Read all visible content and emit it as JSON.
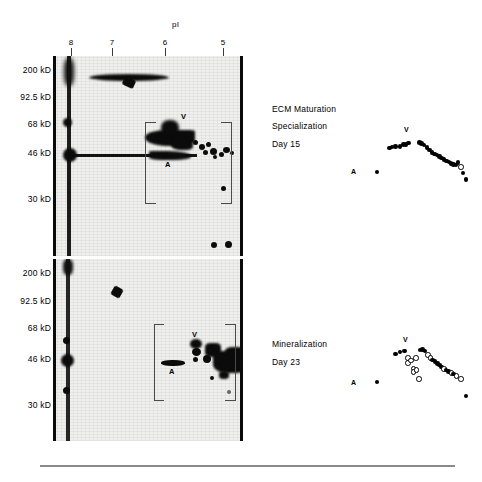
{
  "figure": {
    "axis": {
      "pi_label": "pI",
      "pi_ticks": [
        "8",
        "7",
        "6",
        "5"
      ],
      "mw_labels": [
        "200 kD",
        "92.5 kD",
        "68 kD",
        "46 kD",
        "30 kD"
      ]
    },
    "panels": [
      {
        "id": "panel-top",
        "gel_marks": {
          "v": "V",
          "a": "A"
        },
        "caption_lines": [
          "ECM Maturation",
          "Specialization",
          "Day 15"
        ],
        "schematic_marks": {
          "v": "V",
          "a": "A"
        }
      },
      {
        "id": "panel-bottom",
        "gel_marks": {
          "v": "V",
          "a": "A"
        },
        "caption_lines": [
          "Mineralization",
          "Day 23"
        ],
        "schematic_marks": {
          "v": "V",
          "a": "A"
        }
      }
    ]
  },
  "chart_data": {
    "type": "scatter",
    "xlabel": "pI",
    "ylabel": "Molecular weight (kD)",
    "xlim": [
      8.4,
      4.6
    ],
    "ylim": [
      20,
      230
    ],
    "xticks": [
      8,
      7,
      6,
      5
    ],
    "yticks": [
      200,
      92.5,
      68,
      46,
      30
    ],
    "grid": false,
    "legend": [
      "filled circle = spot present",
      "open circle = spot reduced/absent"
    ],
    "series": [
      {
        "name": "ECM Maturation Specialization Day 15",
        "marker": "filled",
        "annotations": [
          {
            "label": "V",
            "x": 6.55,
            "y": 58
          },
          {
            "label": "A",
            "x": 7.45,
            "y": 40
          }
        ],
        "points": [
          {
            "x": 7.46,
            "y": 40.5,
            "fill": "filled"
          },
          {
            "x": 7.1,
            "y": 53.0,
            "fill": "filled"
          },
          {
            "x": 7.02,
            "y": 53.4,
            "fill": "filled"
          },
          {
            "x": 6.93,
            "y": 53.6,
            "fill": "filled"
          },
          {
            "x": 6.8,
            "y": 53.8,
            "fill": "filled"
          },
          {
            "x": 6.7,
            "y": 54.6,
            "fill": "filled"
          },
          {
            "x": 6.62,
            "y": 54.8,
            "fill": "filled"
          },
          {
            "x": 6.55,
            "y": 55.4,
            "fill": "filled"
          },
          {
            "x": 6.24,
            "y": 55.8,
            "fill": "filled"
          },
          {
            "x": 6.18,
            "y": 55.2,
            "fill": "filled"
          },
          {
            "x": 6.1,
            "y": 54.4,
            "fill": "filled"
          },
          {
            "x": 6.02,
            "y": 53.2,
            "fill": "filled"
          },
          {
            "x": 5.95,
            "y": 51.9,
            "fill": "filled"
          },
          {
            "x": 5.88,
            "y": 50.6,
            "fill": "filled"
          },
          {
            "x": 5.8,
            "y": 49.8,
            "fill": "filled"
          },
          {
            "x": 5.73,
            "y": 49.2,
            "fill": "filled"
          },
          {
            "x": 5.66,
            "y": 48.6,
            "fill": "filled"
          },
          {
            "x": 5.6,
            "y": 47.8,
            "fill": "filled"
          },
          {
            "x": 5.53,
            "y": 47.0,
            "fill": "filled"
          },
          {
            "x": 5.46,
            "y": 46.2,
            "fill": "filled"
          },
          {
            "x": 5.39,
            "y": 45.6,
            "fill": "filled"
          },
          {
            "x": 5.33,
            "y": 45.0,
            "fill": "filled"
          },
          {
            "x": 5.26,
            "y": 44.4,
            "fill": "filled"
          },
          {
            "x": 5.19,
            "y": 44.0,
            "fill": "filled"
          },
          {
            "x": 5.12,
            "y": 45.4,
            "fill": "filled"
          },
          {
            "x": 5.05,
            "y": 43.4,
            "fill": "open"
          },
          {
            "x": 4.98,
            "y": 40.0,
            "fill": "filled"
          },
          {
            "x": 4.9,
            "y": 36.6,
            "fill": "filled"
          }
        ]
      },
      {
        "name": "Mineralization Day 23",
        "marker": "mixed",
        "annotations": [
          {
            "label": "V",
            "x": 6.55,
            "y": 58
          },
          {
            "label": "A",
            "x": 7.45,
            "y": 40
          }
        ],
        "points": [
          {
            "x": 7.46,
            "y": 40.5,
            "fill": "filled"
          },
          {
            "x": 6.93,
            "y": 53.6,
            "fill": "filled"
          },
          {
            "x": 6.8,
            "y": 54.6,
            "fill": "filled"
          },
          {
            "x": 6.66,
            "y": 55.0,
            "fill": "filled"
          },
          {
            "x": 6.58,
            "y": 52.0,
            "fill": "open"
          },
          {
            "x": 6.58,
            "y": 49.6,
            "fill": "open"
          },
          {
            "x": 6.5,
            "y": 50.8,
            "fill": "open"
          },
          {
            "x": 6.35,
            "y": 52.0,
            "fill": "open"
          },
          {
            "x": 6.22,
            "y": 55.4,
            "fill": "filled"
          },
          {
            "x": 6.15,
            "y": 55.6,
            "fill": "filled"
          },
          {
            "x": 6.08,
            "y": 55.0,
            "fill": "filled"
          },
          {
            "x": 6.0,
            "y": 53.4,
            "fill": "open"
          },
          {
            "x": 5.93,
            "y": 52.0,
            "fill": "open"
          },
          {
            "x": 5.86,
            "y": 50.8,
            "fill": "filled"
          },
          {
            "x": 5.79,
            "y": 50.0,
            "fill": "filled"
          },
          {
            "x": 5.72,
            "y": 49.2,
            "fill": "filled"
          },
          {
            "x": 5.66,
            "y": 48.4,
            "fill": "filled"
          },
          {
            "x": 5.6,
            "y": 47.6,
            "fill": "filled"
          },
          {
            "x": 5.54,
            "y": 46.8,
            "fill": "open"
          },
          {
            "x": 5.47,
            "y": 46.0,
            "fill": "filled"
          },
          {
            "x": 5.4,
            "y": 45.4,
            "fill": "filled"
          },
          {
            "x": 5.33,
            "y": 44.8,
            "fill": "open"
          },
          {
            "x": 5.26,
            "y": 44.2,
            "fill": "filled"
          },
          {
            "x": 5.18,
            "y": 43.6,
            "fill": "open"
          },
          {
            "x": 6.42,
            "y": 47.0,
            "fill": "open"
          },
          {
            "x": 6.42,
            "y": 45.4,
            "fill": "open"
          },
          {
            "x": 6.34,
            "y": 46.2,
            "fill": "open"
          },
          {
            "x": 6.27,
            "y": 42.0,
            "fill": "open"
          },
          {
            "x": 5.05,
            "y": 42.0,
            "fill": "open"
          },
          {
            "x": 4.9,
            "y": 34.0,
            "fill": "filled"
          }
        ]
      }
    ]
  }
}
